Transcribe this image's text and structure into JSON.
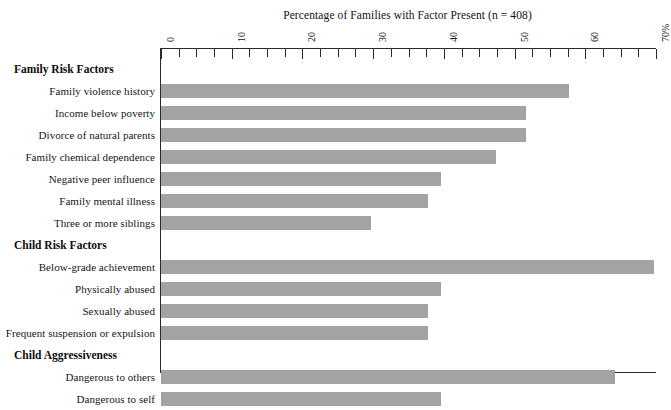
{
  "chart_data": {
    "type": "bar",
    "orientation": "horizontal",
    "title": "Percentage of Families with Factor Present (n = 408)",
    "xlabel": "",
    "ylabel": "",
    "xlim": [
      0,
      70
    ],
    "grid": false,
    "legend": null,
    "sample_size": 408,
    "axis": {
      "tick_labels": [
        "0",
        "10",
        "20",
        "30",
        "40",
        "50",
        "60",
        "70%"
      ],
      "tick_values": [
        0,
        10,
        20,
        30,
        40,
        50,
        60,
        70
      ],
      "minor_tick_step": 2.5,
      "units": "percent"
    },
    "groups": [
      {
        "label": "Family Risk Factors",
        "categories": [
          "Family violence history",
          "Income below poverty",
          "Divorce of natural parents",
          "Family chemical dependence",
          "Negative peer influence",
          "Family mental illness",
          "Three or more siblings"
        ],
        "values": [
          57.7,
          51.6,
          51.6,
          47.4,
          39.6,
          37.8,
          29.7
        ]
      },
      {
        "label": "Child Risk Factors",
        "categories": [
          "Below-grade achievement",
          "Physically abused",
          "Sexually abused",
          "Frequent suspension or expulsion"
        ],
        "values": [
          69.7,
          39.6,
          37.8,
          37.8
        ]
      },
      {
        "label": "Child Aggressiveness",
        "categories": [
          "Dangerous to others",
          "Dangerous to self"
        ],
        "values": [
          64.2,
          39.6
        ]
      }
    ],
    "categories": [
      "Family violence history",
      "Income below poverty",
      "Divorce of natural parents",
      "Family chemical dependence",
      "Negative peer influence",
      "Family mental illness",
      "Three or more siblings",
      "Below-grade achievement",
      "Physically abused",
      "Sexually abused",
      "Frequent suspension or expulsion",
      "Dangerous to others",
      "Dangerous to self"
    ],
    "values": [
      57.7,
      51.6,
      51.6,
      47.4,
      39.6,
      37.8,
      29.7,
      69.7,
      39.6,
      37.8,
      37.8,
      64.2,
      39.6
    ],
    "colors": {
      "bar": "#a3a3a3",
      "axis": "#2b2b2b",
      "text": "#151515",
      "background": "#ffffff"
    }
  }
}
